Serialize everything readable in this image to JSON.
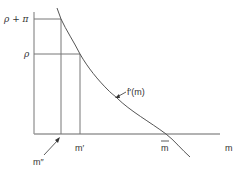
{
  "diagram": {
    "labels": {
      "y_upper": "ρ + π",
      "y_lower": "ρ",
      "curve": "f′(m)",
      "x_m_prime": "m′",
      "x_m_bar": "m",
      "x_axis": "m",
      "x_m_double_prime": "m″"
    },
    "colors": {
      "axis": "#777777",
      "lines": "#666666",
      "curve": "#555555",
      "text": "#333333"
    }
  }
}
